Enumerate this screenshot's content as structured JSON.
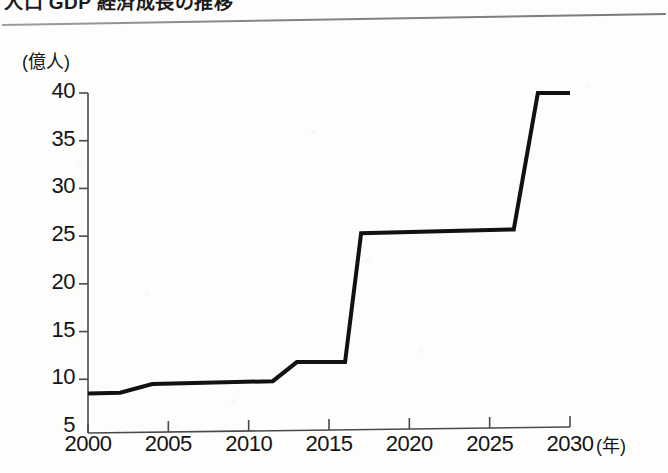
{
  "page": {
    "heading_partial": "人口 GDP 経済成長の推移",
    "background_color": "#fdfdfc",
    "ink_color": "#121212"
  },
  "chart_data": {
    "type": "line",
    "title": "",
    "xlabel": "(年)",
    "ylabel": "(億人)",
    "y_unit_label": "(億人)",
    "x_unit_label": "(年)",
    "xlim": [
      2000,
      2030
    ],
    "ylim": [
      5,
      40
    ],
    "grid": false,
    "legend": "none",
    "axis_color": "#4a4a4a",
    "line_color": "#111111",
    "line_width_px": 4,
    "yticks": [
      5,
      10,
      15,
      20,
      25,
      30,
      35,
      40
    ],
    "ytick_labels": [
      "5",
      "10",
      "15",
      "20",
      "25",
      "30",
      "35",
      "40"
    ],
    "xticks": [
      2000,
      2005,
      2010,
      2015,
      2020,
      2025,
      2030
    ],
    "xtick_labels": [
      "2000",
      "2005",
      "2010",
      "2015",
      "2020",
      "2025",
      "2030"
    ],
    "series": [
      {
        "name": "population",
        "x": [
          2000,
          2002,
          2004,
          2011.5,
          2013,
          2016,
          2017,
          2026.5,
          2028,
          2030
        ],
        "values": [
          8.5,
          8.6,
          9.5,
          9.8,
          11.8,
          11.8,
          25.3,
          25.7,
          40.0,
          40.0
        ]
      }
    ]
  }
}
